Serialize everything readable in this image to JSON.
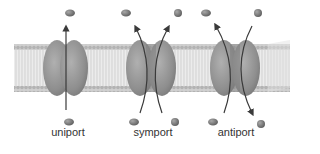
{
  "diagram": {
    "type": "membrane-transport-proteins",
    "colors": {
      "membrane_head": "#b9b9b9",
      "membrane_tail": "#d6d6d6",
      "protein": "#8f8f8f",
      "protein_dark": "#6f6f6f",
      "arrow": "#3a3a3a",
      "solute_a": "#7a7a7a",
      "solute_b": "#6a6a6a"
    },
    "transporters": [
      {
        "name": "uniport",
        "label": "uniport",
        "cx": 65
      },
      {
        "name": "symport",
        "label": "symport",
        "cx": 150
      },
      {
        "name": "antiport",
        "label": "antiport",
        "cx": 236
      }
    ]
  }
}
